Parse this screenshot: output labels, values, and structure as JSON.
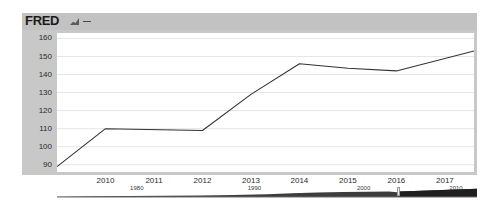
{
  "widget": {
    "name": "FRED economic data chart",
    "logo_text": "FRED",
    "logo_icon": "line-chart-icon",
    "dash_icon": "series-line-icon"
  },
  "colors": {
    "frame_gray": "#c8c8c8",
    "header_gray": "#c2c2c2",
    "plot_white": "#ffffff",
    "gridline": "#e6e6e6",
    "series_line": "#333333",
    "navigator_area": "#3d3d3d",
    "navigator_selection": "#1f1f1f",
    "axis_text": "#2b2b2b"
  },
  "chart_data": {
    "type": "line",
    "title": "FRED",
    "xlabel": "",
    "ylabel": "",
    "grid": true,
    "legend": "none",
    "xlim": [
      2009.0,
      2017.6
    ],
    "ylim": [
      86,
      163
    ],
    "y_ticks": [
      90,
      100,
      110,
      120,
      130,
      140,
      150,
      160
    ],
    "x_ticks": [
      2010,
      2011,
      2012,
      2013,
      2014,
      2015,
      2016,
      2017
    ],
    "x_tick_labels": [
      "2010",
      "2011",
      "2012",
      "2013",
      "2014",
      "2015",
      "2016",
      "2017"
    ],
    "y_tick_labels": [
      "160",
      "150",
      "140",
      "130",
      "120",
      "110",
      "100",
      "90"
    ],
    "series": [
      {
        "name": "series-1",
        "x": [
          2009.0,
          2010.0,
          2012.0,
          2013.0,
          2014.0,
          2015.0,
          2016.0,
          2017.6
        ],
        "values": [
          89,
          110,
          109,
          129,
          146,
          143.5,
          142,
          153
        ]
      }
    ]
  },
  "navigator": {
    "name": "date-range-navigator",
    "labels": [
      "1980",
      "1990",
      "2000",
      "2010"
    ],
    "label_positions": [
      0.19,
      0.47,
      0.73,
      0.95
    ],
    "selection_start_fraction": 0.812,
    "selection_end_fraction": 1.0,
    "overview_x": [
      0,
      0.08,
      0.17,
      0.26,
      0.34,
      0.42,
      0.5,
      0.56,
      0.62,
      0.68,
      0.74,
      0.79,
      0.81,
      0.815,
      0.85,
      0.9,
      0.95,
      1.0
    ],
    "overview_values": [
      0.04,
      0.07,
      0.1,
      0.14,
      0.18,
      0.22,
      0.3,
      0.42,
      0.5,
      0.56,
      0.58,
      0.6,
      0.52,
      0.62,
      0.68,
      0.74,
      0.82,
      0.92
    ]
  }
}
